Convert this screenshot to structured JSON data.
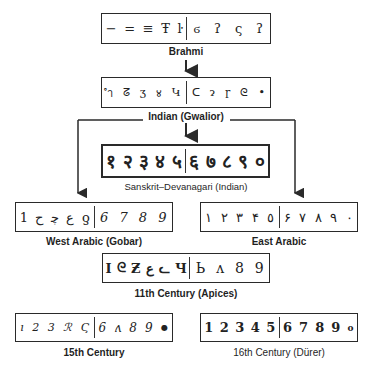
{
  "diagram": {
    "nodes": [
      {
        "id": "brahmi",
        "label": "Brahmi",
        "left_glyphs": [
          "−",
          "=",
          "≡",
          "Ŧ",
          "ŀ"
        ],
        "right_glyphs": [
          "ϭ",
          "ʔ",
          "ς",
          "ʔ"
        ]
      },
      {
        "id": "gwalior",
        "label": "Indian (Gwalior)",
        "left_glyphs": [
          "ำ",
          "ᘔ",
          "ʒ",
          "४",
          "Կ"
        ],
        "right_glyphs": [
          "ᑕ",
          "ɂ",
          "ɼ",
          "ᘓ",
          "•"
        ]
      },
      {
        "id": "devanagari",
        "label": "Sanskrit–Devanagari (Indian)",
        "left_glyphs": [
          "१",
          "२",
          "३",
          "४",
          "५"
        ],
        "right_glyphs": [
          "६",
          "७",
          "८",
          "९",
          "०"
        ]
      },
      {
        "id": "west-arabic",
        "label": "West Arabic (Gobar)",
        "left_glyphs": [
          "1",
          "ح",
          "ﭼ",
          "ع",
          "ƍ"
        ],
        "right_glyphs": [
          "6",
          "7",
          "8",
          "9"
        ]
      },
      {
        "id": "east-arabic",
        "label": "East Arabic",
        "left_glyphs": [
          "١",
          "٢",
          "٣",
          "۴",
          "٥"
        ],
        "right_glyphs": [
          "۶",
          "٧",
          "٨",
          "٩",
          "٠"
        ]
      },
      {
        "id": "apices",
        "label": "11th Century (Apices)",
        "left_glyphs": [
          "I",
          "ᘓ",
          "Ƶ",
          "ع",
          "ᓚ",
          "Ч"
        ],
        "right_glyphs": [
          "Ь",
          "ʌ",
          "8",
          "9"
        ]
      },
      {
        "id": "c15",
        "label": "15th Century",
        "left_glyphs": [
          "ı",
          "2",
          "3",
          "ℛ",
          "Ϛ"
        ],
        "right_glyphs": [
          "6",
          "ʌ",
          "8",
          "9",
          "●"
        ]
      },
      {
        "id": "c16",
        "label": "16th Century (Dürer)",
        "left_glyphs": [
          "1",
          "2",
          "3",
          "4",
          "5"
        ],
        "right_glyphs": [
          "6",
          "7",
          "8",
          "9",
          "o"
        ]
      }
    ],
    "edges": [
      [
        "brahmi",
        "gwalior"
      ],
      [
        "gwalior",
        "devanagari"
      ],
      [
        "gwalior",
        "west-arabic"
      ],
      [
        "gwalior",
        "east-arabic"
      ]
    ],
    "colors": {
      "line": "#2a2a2a",
      "text": "#1f1f1f",
      "background": "#ffffff"
    }
  }
}
